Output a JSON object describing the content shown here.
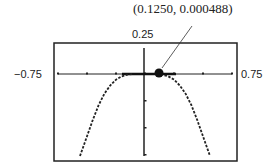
{
  "chart_data": {
    "type": "line",
    "title": "",
    "xlabel": "",
    "ylabel": "",
    "xlim": [
      -0.75,
      0.75
    ],
    "ylim": [
      -0.25,
      0.25
    ],
    "window_labels": {
      "xmin": "−0.75",
      "xmax": "0.75",
      "ymax": "0.25",
      "ymin": "−0.25"
    },
    "grid": false,
    "legend": null,
    "x_ticks": [
      -0.75,
      -0.5,
      -0.25,
      0,
      0.25,
      0.5,
      0.75
    ],
    "y_ticks": [
      -0.25,
      -0.2,
      -0.15,
      -0.1,
      -0.05,
      0
    ],
    "series": [
      {
        "name": "curve",
        "style": "dotted-pixel",
        "x": [
          -0.56,
          -0.5,
          -0.45,
          -0.4,
          -0.35,
          -0.3,
          -0.25,
          -0.2,
          -0.15,
          -0.1,
          0,
          0.1,
          0.15,
          0.2,
          0.25,
          0.3,
          0.35,
          0.4,
          0.45,
          0.5,
          0.56
        ],
        "y": [
          -0.25,
          -0.19,
          -0.14,
          -0.095,
          -0.06,
          -0.035,
          -0.017,
          -0.007,
          -0.002,
          0,
          0,
          0,
          -0.002,
          -0.007,
          -0.017,
          -0.035,
          -0.06,
          -0.095,
          -0.14,
          -0.19,
          -0.25
        ]
      }
    ],
    "annotations": [
      {
        "text": "(0.1250, 0.000488)",
        "point": [
          0.125,
          0.000488
        ],
        "marker": "filled-circle"
      }
    ]
  }
}
